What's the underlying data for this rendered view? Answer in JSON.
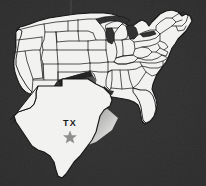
{
  "figure": {
    "type": "map",
    "highlighted_state": "Texas",
    "width": 206,
    "height": 186
  },
  "background": {
    "color": "#2e2e2e",
    "description": "dark charcoal noisy backdrop"
  },
  "colors": {
    "land_fill": "#f4f4f2",
    "state_border": "#1a1a1a",
    "coast_outline": "#111111",
    "callout_shadow_dark": "#242424",
    "callout_shadow_light": "#d8d8d6",
    "label_text": "#141414",
    "star_fill": "#8d8d8d",
    "background": "#2e2e2e"
  },
  "callout": {
    "state_abbrev": "TX",
    "state_name": "Texas",
    "capital_marker": "star",
    "capital_marker_label": "Austin",
    "label_x": 70,
    "label_y": 124,
    "star_x": 70,
    "star_y": 136
  },
  "legend": {
    "visible": false,
    "entries": []
  },
  "annotations": [
    {
      "text": "TX",
      "x": 70,
      "y": 124,
      "kind": "state-abbreviation"
    }
  ]
}
